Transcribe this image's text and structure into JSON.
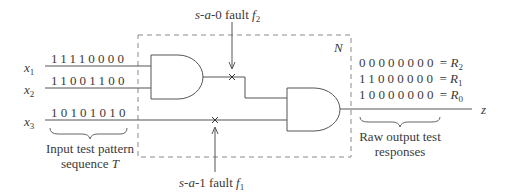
{
  "network_label": "N",
  "inputs": [
    {
      "var": "x",
      "sub": "1",
      "pattern": "11110000"
    },
    {
      "var": "x",
      "sub": "2",
      "pattern": "11001100"
    },
    {
      "var": "x",
      "sub": "3",
      "pattern": "10101010"
    }
  ],
  "input_caption": {
    "line1": "Input test pattern",
    "line2_prefix": "sequence ",
    "line2_var": "T"
  },
  "faults": {
    "f2": {
      "prefix": "s",
      "mid": "a",
      "value": "-0",
      "word": " fault ",
      "var": "f",
      "sub": "2"
    },
    "f1": {
      "prefix": "s",
      "mid": "a",
      "value": "-1",
      "word": " fault ",
      "var": "f",
      "sub": "1"
    }
  },
  "outputs": [
    {
      "pattern": "00000000",
      "eq": " = ",
      "var": "R",
      "sub": "2"
    },
    {
      "pattern": "11000000",
      "eq": " = ",
      "var": "R",
      "sub": "1"
    },
    {
      "pattern": "10000000",
      "eq": " = ",
      "var": "R",
      "sub": "0"
    }
  ],
  "output_var": "z",
  "output_caption": {
    "line1": "Raw output test",
    "line2": "responses"
  },
  "colors": {
    "line": "#555555",
    "dash": "#888888",
    "text": "#3a3a3a"
  }
}
